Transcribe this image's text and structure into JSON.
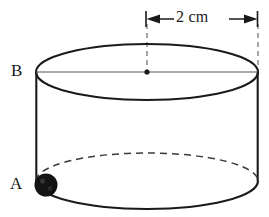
{
  "figure": {
    "type": "geometry-diagram",
    "background_color": "#ffffff",
    "stroke_color": "#1a1a1a",
    "thin_line_color": "#555555",
    "dash_color": "#3a3a3a",
    "labels": {
      "point_a": "A",
      "point_b": "B"
    },
    "dimension": {
      "text": "2 cm",
      "value": 2,
      "unit": "cm",
      "measures": "radius",
      "arrow_left": "arrow-left",
      "arrow_right": "arrow-right"
    },
    "geometry": {
      "top_ellipse": {
        "cx": 147,
        "cy": 72,
        "rx": 111,
        "ry": 28
      },
      "bottom_ellipse": {
        "cx": 147,
        "cy": 181,
        "rx": 111,
        "ry": 28
      },
      "center_dot": {
        "cx": 147,
        "cy": 72,
        "r": 2.6
      },
      "bead_at_a": {
        "cx": 46,
        "cy": 185,
        "r": 11.5,
        "fill": "#141414"
      },
      "dimension_line_y": 19,
      "dimension_from_x": 145,
      "dimension_to_x": 258
    }
  }
}
